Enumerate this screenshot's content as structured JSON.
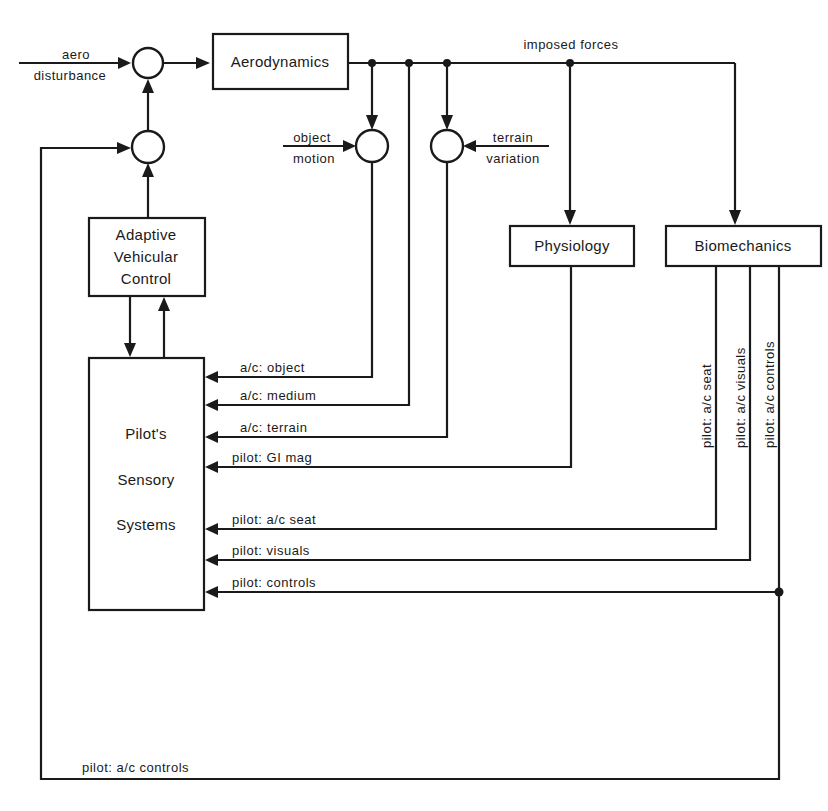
{
  "diagram": {
    "blocks": {
      "aerodynamics": "Aerodynamics",
      "adaptive_vehicular_control": [
        "Adaptive",
        "Vehicular",
        "Control"
      ],
      "physiology": "Physiology",
      "biomechanics": "Biomechanics",
      "pilots_sensory_systems": [
        "Pilot's",
        "Sensory",
        "Systems"
      ]
    },
    "inputs": {
      "aero_disturbance": [
        "aero",
        "disturbance"
      ],
      "object_motion": [
        "object",
        "motion"
      ],
      "terrain_variation": [
        "terrain",
        "variation"
      ]
    },
    "signals": {
      "imposed_forces": "imposed forces",
      "ac_object": "a/c:  object",
      "ac_medium": "a/c:  medium",
      "ac_terrain": "a/c:  terrain",
      "pilot_gi_mag": "pilot: GI mag",
      "pilot_ac_seat": "pilot:  a/c  seat",
      "pilot_visuals": "pilot:  visuals",
      "pilot_controls": "pilot:  controls",
      "vertical_pilot_ac_seat": "pilot:  a/c  seat",
      "vertical_pilot_ac_visuals": "pilot:  a/c  visuals",
      "vertical_pilot_ac_controls": "pilot:  a/c  controls",
      "return_pilot_ac_controls": "pilot:  a/c  controls"
    },
    "colors": {
      "ink": "#1a1a1a",
      "background": "#ffffff"
    }
  }
}
